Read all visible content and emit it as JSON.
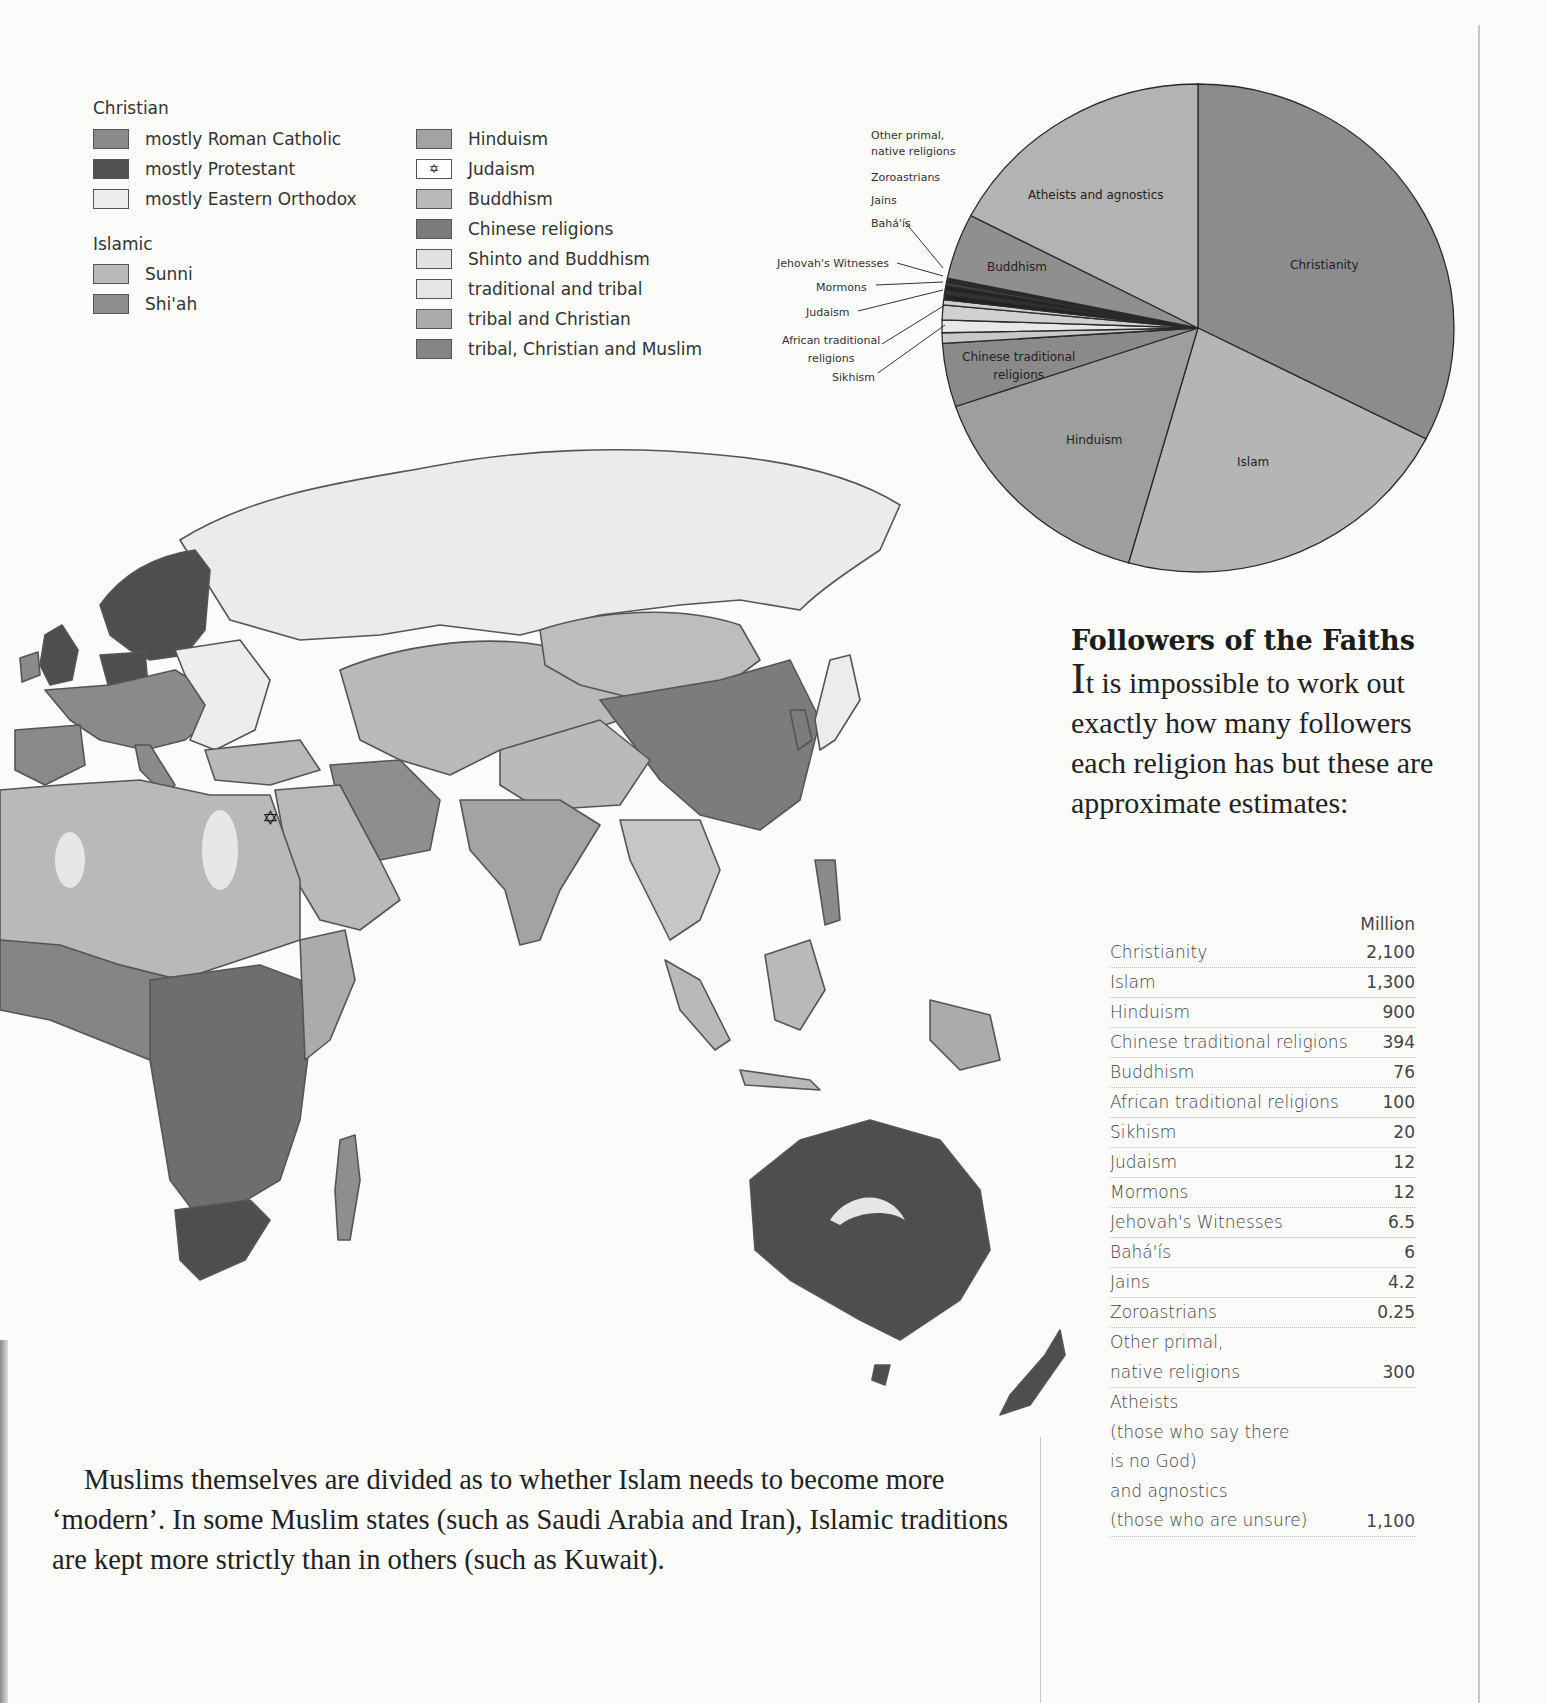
{
  "legend": {
    "christian": {
      "title": "Christian",
      "items": [
        {
          "label": "mostly Roman Catholic",
          "color": "#8a8a8a"
        },
        {
          "label": "mostly Protestant",
          "color": "#505050"
        },
        {
          "label": "mostly Eastern Orthodox",
          "color": "#ececec"
        }
      ]
    },
    "islamic": {
      "title": "Islamic",
      "items": [
        {
          "label": "Sunni",
          "color": "#b9b9b9"
        },
        {
          "label": "Shi'ah",
          "color": "#8e8e8e"
        }
      ]
    },
    "other": {
      "items": [
        {
          "label": "Hinduism",
          "color": "#a3a3a3",
          "symbol": ""
        },
        {
          "label": "Judaism",
          "color": "#ffffff",
          "symbol": "✡"
        },
        {
          "label": "Buddhism",
          "color": "#bababa",
          "symbol": ""
        },
        {
          "label": "Chinese religions",
          "color": "#7c7c7c",
          "symbol": ""
        },
        {
          "label": "Shinto and Buddhism",
          "color": "#e2e2e2",
          "symbol": ""
        },
        {
          "label": "traditional and tribal",
          "color": "#e6e6e6",
          "symbol": ""
        },
        {
          "label": "tribal and Christian",
          "color": "#ababab",
          "symbol": ""
        },
        {
          "label": "tribal, Christian and Muslim",
          "color": "#858585",
          "symbol": ""
        }
      ]
    }
  },
  "pie_callouts": {
    "other_primal": "Other primal,\nnative religions",
    "other_primal_line1": "Other primal,",
    "other_primal_line2": "native religions",
    "zoroastrians": "Zoroastrians",
    "jains": "Jains",
    "bahais": "Bahá'ís",
    "jehovahs": "Jehovah's Witnesses",
    "mormons": "Mormons",
    "judaism": "Judaism",
    "african_line1": "African traditional",
    "african_line2": "religions",
    "sikhism": "Sikhism"
  },
  "pie_inner_labels": {
    "atheists": "Atheists and agnostics",
    "buddhism": "Buddhism",
    "christianity": "Christianity",
    "chinese_line1": "Chinese traditional",
    "chinese_line2": "religions",
    "hinduism": "Hinduism",
    "islam": "Islam"
  },
  "article": {
    "heading": "Followers of the Faiths",
    "intro_dropcap": "I",
    "intro_rest": "t is impossible to work out exactly how many followers each religion has but these are approximate estimates:",
    "table_unit_header": "Million",
    "body_text": "Muslims themselves are divided as to whether Islam needs to become more ‘modern’. In some Muslim states (such as Saudi Arabia and Iran), Islamic traditions are kept more strictly than in others (such as Kuwait)."
  },
  "table": {
    "rows": [
      {
        "name": "Christianity",
        "value": "2,100"
      },
      {
        "name": "Islam",
        "value": "1,300"
      },
      {
        "name": "Hinduism",
        "value": "900"
      },
      {
        "name": "Chinese traditional religions",
        "value": "394"
      },
      {
        "name": "Buddhism",
        "value": "76"
      },
      {
        "name": "African traditional religions",
        "value": "100"
      },
      {
        "name": "Sikhism",
        "value": "20"
      },
      {
        "name": "Judaism",
        "value": "12"
      },
      {
        "name": "Mormons",
        "value": "12"
      },
      {
        "name": "Jehovah's Witnesses",
        "value": "6.5"
      },
      {
        "name": "Bahá'ís",
        "value": "6"
      },
      {
        "name": "Jains",
        "value": "4.2"
      },
      {
        "name": "Zoroastrians",
        "value": "0.25"
      }
    ],
    "other_primal": {
      "line1": "Other primal,",
      "line2": "native religions",
      "value": "300"
    },
    "atheists": {
      "line1": "Atheists",
      "line2": "(those who say there",
      "line3": "is no God)",
      "line4": "and agnostics",
      "line5": "(those who are unsure)",
      "value": "1,100"
    }
  },
  "chart_data": {
    "type": "pie",
    "title": "Followers of the Faiths",
    "unit": "Million",
    "categories": [
      "Christianity",
      "Islam",
      "Hinduism",
      "Chinese traditional religions",
      "Sikhism",
      "African traditional religions",
      "Judaism",
      "Mormons",
      "Jehovah's Witnesses",
      "Bahá'ís",
      "Jains",
      "Zoroastrians",
      "Other primal, native religions",
      "Buddhism",
      "Atheists and agnostics"
    ],
    "values": [
      2100,
      1300,
      900,
      394,
      20,
      100,
      12,
      12,
      6.5,
      6,
      4.2,
      0.25,
      300,
      76,
      1100
    ],
    "slice_colors": [
      "#8c8c8c",
      "#b5b5b5",
      "#9e9e9e",
      "#8a8a8a",
      "#c8c8c8",
      "#e8e8e8",
      "#d0d0d0",
      "#cfcfcf",
      "#222222",
      "#333333",
      "#222222",
      "#444444",
      "#2a2a2a",
      "#8f8f8f",
      "#b3b3b3"
    ],
    "start_angle_deg": 0,
    "direction": "clockwise",
    "legend_position": "callout labels left"
  }
}
